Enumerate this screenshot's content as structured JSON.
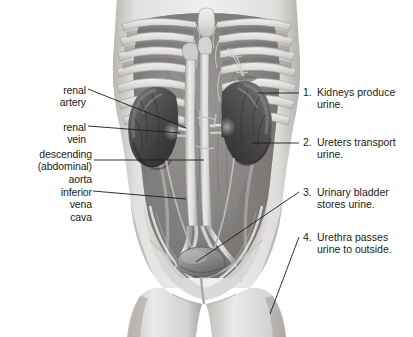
{
  "figure": {
    "background_color": "#ffffff",
    "ink_color": "#1b1b1b"
  },
  "left_labels": [
    {
      "id": "renal-artery",
      "text": "renal\nartery",
      "x": 45,
      "y": 84,
      "anchor_x": 88,
      "anchor_y": 89,
      "tip_x": 186,
      "tip_y": 128
    },
    {
      "id": "renal-vein",
      "text": "renal\nvein",
      "x": 45,
      "y": 121,
      "anchor_x": 88,
      "anchor_y": 126,
      "tip_x": 180,
      "tip_y": 133
    },
    {
      "id": "descending-aorta",
      "text": "descending\n(abdominal)\naorta",
      "x": 18,
      "y": 148,
      "anchor_x": 94,
      "anchor_y": 160,
      "tip_x": 204,
      "tip_y": 160
    },
    {
      "id": "inferior-vena-cava",
      "text": "inferior\nvena\ncava",
      "x": 47,
      "y": 186,
      "anchor_x": 93,
      "anchor_y": 191,
      "tip_x": 186,
      "tip_y": 199
    }
  ],
  "numbered_labels": [
    {
      "num": "1.",
      "text": "Kidneys produce\nurine.",
      "x": 303,
      "y": 86,
      "anchor_x": 299,
      "anchor_y": 93,
      "tip_x": 257,
      "tip_y": 93
    },
    {
      "num": "2.",
      "text": "Ureters transport\nurine.",
      "x": 303,
      "y": 136,
      "anchor_x": 299,
      "anchor_y": 143,
      "tip_x": 252,
      "tip_y": 143
    },
    {
      "num": "3.",
      "text": "Urinary bladder\nstores urine.",
      "x": 303,
      "y": 186,
      "anchor_x": 299,
      "anchor_y": 192,
      "tip_x": 196,
      "tip_y": 262
    },
    {
      "num": "4.",
      "text": "Urethra passes\nurine to outside.",
      "x": 303,
      "y": 231,
      "anchor_x": 299,
      "anchor_y": 237,
      "tip_x": 270,
      "tip_y": 314
    }
  ],
  "illustration": {
    "style": "grayscale medical halftone",
    "structures": [
      "ribcage",
      "sternum",
      "abdominal-cavity",
      "left-kidney",
      "right-kidney",
      "renal-artery",
      "renal-vein",
      "abdominal-aorta",
      "inferior-vena-cava",
      "ureters",
      "urinary-bladder",
      "urethra",
      "pelvis",
      "thighs"
    ],
    "palette": {
      "skin_light": "#e8e6e4",
      "skin_mid": "#c9c6c3",
      "skin_dark": "#9a9794",
      "cavity_mid": "#8f8d8b",
      "cavity_dark": "#6e6c6a",
      "bone": "#e2e0de",
      "bone_shadow": "#b4b1ae",
      "organ_dark": "#4e4c4b",
      "organ_mid": "#6b6967",
      "vessel_light": "#dedcda"
    }
  }
}
